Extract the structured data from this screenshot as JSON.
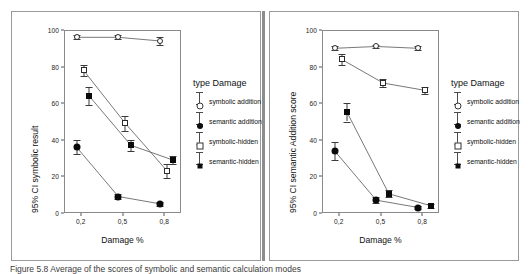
{
  "figure": {
    "caption": "Figure 5.8 Average of the scores of symbolic and semantic calculation modes"
  },
  "panels": [
    {
      "id": "left",
      "ylabel": "95% CI symbolic result",
      "xlabel": "Damage %",
      "legend_title": "type Damage",
      "legend": [
        {
          "label": "symbolic addition",
          "marker": "circ-o"
        },
        {
          "label": "semantic addition",
          "marker": "circ-f"
        },
        {
          "label": "symbolic-hidden",
          "marker": "sq-o"
        },
        {
          "label": "semantic-hidden",
          "marker": "sq-f"
        }
      ]
    },
    {
      "id": "right",
      "ylabel": "95% CI semantic Addition score",
      "xlabel": "Damage %",
      "legend_title": "type Damage",
      "legend": [
        {
          "label": "symbolic addition",
          "marker": "circ-o"
        },
        {
          "label": "semantic addition",
          "marker": "circ-f"
        },
        {
          "label": "symbolic-hidden",
          "marker": "sq-o"
        },
        {
          "label": "semantic-hidden",
          "marker": "sq-f"
        }
      ]
    }
  ],
  "chart_data": [
    {
      "type": "line",
      "title": "",
      "xlabel": "Damage %",
      "ylabel": "95% CI symbolic result",
      "xlim": [
        0.08,
        0.92
      ],
      "ylim": [
        0,
        100
      ],
      "yticks": [
        0,
        20,
        40,
        60,
        80,
        100
      ],
      "xticks": [
        0.2,
        0.5,
        0.8
      ],
      "xticklabels": [
        "0,2",
        "0,5",
        "0,8"
      ],
      "grid": false,
      "legend_position": "right",
      "legend_title": "type Damage",
      "series": [
        {
          "name": "symbolic addition",
          "marker": "open-circle",
          "x": [
            0.17,
            0.47,
            0.77
          ],
          "values": [
            96,
            96,
            94
          ],
          "err_low": [
            1,
            1,
            2
          ],
          "err_high": [
            1,
            1,
            2
          ]
        },
        {
          "name": "semantic addition",
          "marker": "filled-circle",
          "x": [
            0.17,
            0.47,
            0.77
          ],
          "values": [
            36,
            9,
            5
          ],
          "err_low": [
            4,
            1.5,
            1
          ],
          "err_high": [
            4,
            1.5,
            1
          ]
        },
        {
          "name": "symbolic-hidden",
          "marker": "open-square",
          "x": [
            0.22,
            0.52,
            0.82
          ],
          "values": [
            78,
            49,
            23
          ],
          "err_low": [
            3,
            4,
            4
          ],
          "err_high": [
            3,
            4,
            4
          ]
        },
        {
          "name": "semantic-hidden",
          "marker": "filled-square",
          "x": [
            0.26,
            0.56,
            0.86
          ],
          "values": [
            64,
            37,
            29
          ],
          "err_low": [
            5,
            3,
            2
          ],
          "err_high": [
            5,
            3,
            2
          ]
        }
      ]
    },
    {
      "type": "line",
      "title": "",
      "xlabel": "Damage %",
      "ylabel": "95% CI semantic Addition score",
      "xlim": [
        0.08,
        0.92
      ],
      "ylim": [
        0,
        100
      ],
      "yticks": [
        0,
        20,
        40,
        60,
        80,
        100
      ],
      "xticks": [
        0.2,
        0.5,
        0.8
      ],
      "xticklabels": [
        "0,2",
        "0,5",
        "0,8"
      ],
      "grid": false,
      "legend_position": "right",
      "legend_title": "type Damage",
      "series": [
        {
          "name": "symbolic addition",
          "marker": "open-circle",
          "x": [
            0.17,
            0.47,
            0.77
          ],
          "values": [
            90,
            91,
            90
          ],
          "err_low": [
            1,
            1,
            1
          ],
          "err_high": [
            1,
            1,
            1
          ]
        },
        {
          "name": "semantic addition",
          "marker": "filled-circle",
          "x": [
            0.17,
            0.47,
            0.77
          ],
          "values": [
            34,
            7,
            3
          ],
          "err_low": [
            5,
            1.5,
            1
          ],
          "err_high": [
            5,
            1.5,
            1
          ]
        },
        {
          "name": "symbolic-hidden",
          "marker": "open-square",
          "x": [
            0.22,
            0.52,
            0.82
          ],
          "values": [
            84,
            71,
            67
          ],
          "err_low": [
            3,
            2,
            2
          ],
          "err_high": [
            3,
            2,
            2
          ]
        },
        {
          "name": "semantic-hidden",
          "marker": "filled-square",
          "x": [
            0.26,
            0.56,
            0.86
          ],
          "values": [
            55,
            10.5,
            4
          ],
          "err_low": [
            5,
            2,
            1
          ],
          "err_high": [
            5,
            2,
            1
          ]
        }
      ]
    }
  ]
}
